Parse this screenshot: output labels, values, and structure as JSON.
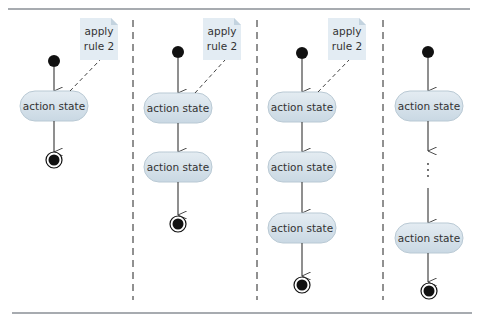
{
  "diagram": {
    "type": "uml-activity-nesting-rule-illustration",
    "colors": {
      "rule": "#8a8f96",
      "state_fill": "#d6e2ea",
      "state_stroke": "#b9c9d4",
      "note_fill": "#e3ecf3",
      "note_fold": "#c3d3df",
      "line": "#333333",
      "separator": "#222222"
    },
    "panels": [
      {
        "id": "panel-1",
        "note": {
          "line1": "apply",
          "line2": "rule 2"
        },
        "states": [
          {
            "label": "action state"
          }
        ],
        "has_ellipsis": false
      },
      {
        "id": "panel-2",
        "note": {
          "line1": "apply",
          "line2": "rule 2"
        },
        "states": [
          {
            "label": "action state"
          },
          {
            "label": "action state"
          }
        ],
        "has_ellipsis": false
      },
      {
        "id": "panel-3",
        "note": {
          "line1": "apply",
          "line2": "rule 2"
        },
        "states": [
          {
            "label": "action state"
          },
          {
            "label": "action state"
          },
          {
            "label": "action state"
          }
        ],
        "has_ellipsis": false
      },
      {
        "id": "panel-4",
        "note": null,
        "states": [
          {
            "label": "action state"
          },
          {
            "label": "action state"
          }
        ],
        "has_ellipsis": true,
        "ellipsis": "⋮"
      }
    ]
  }
}
